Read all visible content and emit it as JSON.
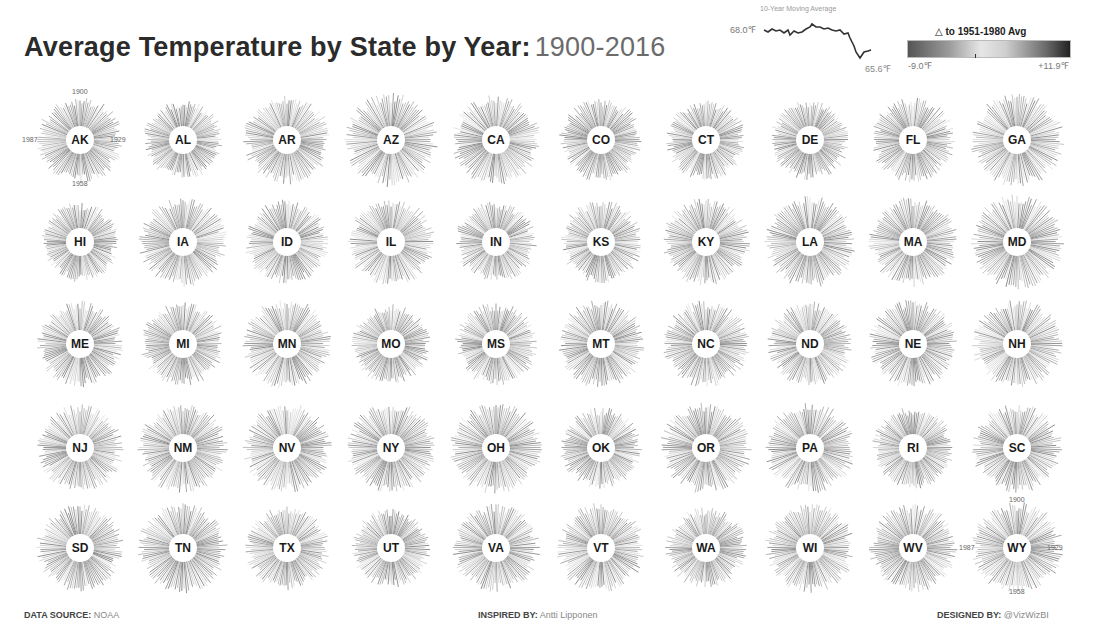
{
  "header": {
    "title_bold": "Average Temperature by State by Year:",
    "title_years": "1900-2016"
  },
  "sparkline": {
    "title": "10-Year Moving Average",
    "start_label": "68.0℉",
    "end_label": "65.6℉"
  },
  "legend": {
    "title": "△ to 1951-1980 Avg",
    "min_label": "-9.0℉",
    "max_label": "+11.9℉",
    "colors": [
      "#555555",
      "#e6e6e6",
      "#222222"
    ]
  },
  "year_markers": {
    "top": "1900",
    "right": "1929",
    "bottom": "1958",
    "left": "1987"
  },
  "footer": {
    "source_label": "DATA SOURCE:",
    "source_value": " NOAA",
    "inspired_label": "INSPIRED BY:",
    "inspired_value": " Antti Lipponen",
    "designed_label": "DESIGNED BY:",
    "designed_value": " @VizWizBI"
  },
  "chart_data": {
    "type": "radial-bar-small-multiples",
    "angular_axis": "Year (1900 at top, clockwise: 1929 right, 1958 bottom, 1987 left)",
    "radial_encoding": "Annual average temperature",
    "color_encoding": "Δ to 1951-1980 Avg, range -9.0℉ to +11.9℉",
    "sparkline": {
      "title": "10-Year Moving Average",
      "start_value": 68.0,
      "end_value": 65.6,
      "unit": "℉"
    },
    "grid": {
      "rows": 5,
      "cols": 10
    },
    "states": [
      [
        "AK",
        "AL",
        "AR",
        "AZ",
        "CA",
        "CO",
        "CT",
        "DE",
        "FL",
        "GA"
      ],
      [
        "HI",
        "IA",
        "ID",
        "IL",
        "IN",
        "KS",
        "KY",
        "LA",
        "MA",
        "MD"
      ],
      [
        "ME",
        "MI",
        "MN",
        "MO",
        "MS",
        "MT",
        "NC",
        "ND",
        "NE",
        "NH"
      ],
      [
        "NJ",
        "NM",
        "NV",
        "NY",
        "OH",
        "OK",
        "OR",
        "PA",
        "RI",
        "SC"
      ],
      [
        "SD",
        "TN",
        "TX",
        "UT",
        "VA",
        "VT",
        "WA",
        "WI",
        "WV",
        "WY"
      ]
    ]
  }
}
